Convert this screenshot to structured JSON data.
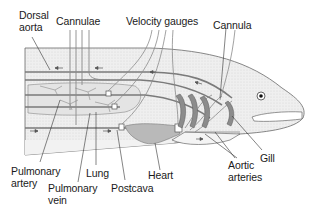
{
  "figure": {
    "colors": {
      "body_fill": "#ececec",
      "body_stipple": "#d6d6d6",
      "outline": "#555555",
      "vessel": "#7a7a7a",
      "heart_fill": "#b9b9b9",
      "gill_fill": "#8c8c8c",
      "text": "#1a1a1a"
    }
  },
  "labels": {
    "dorsal_aorta": "Dorsal\naorta",
    "cannulae": "Cannulae",
    "velocity_gauges": "Velocity gauges",
    "cannula": "Cannula",
    "pulmonary_artery": "Pulmonary\nartery",
    "lung": "Lung",
    "pulmonary_vein": "Pulmonary\nvein",
    "postcava": "Postcava",
    "heart": "Heart",
    "aortic_arteries": "Aortic\narteries",
    "gill": "Gill"
  }
}
